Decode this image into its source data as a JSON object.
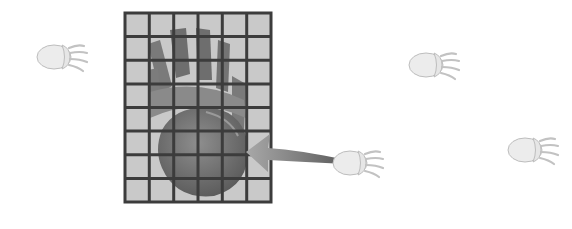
{
  "diagram": {
    "grid": {
      "columns": 6,
      "rows": 8,
      "x": 125,
      "y": 13,
      "width": 146,
      "height": 189,
      "fill": "#c9c9c9",
      "line_color": "#3c3c3c"
    },
    "large_paw": {
      "color": "#6e6e6e"
    },
    "small_paws": [
      {
        "x": 38,
        "y": 40,
        "label": "paw-print-left"
      },
      {
        "x": 408,
        "y": 48,
        "label": "paw-print-upper-right"
      },
      {
        "x": 332,
        "y": 146,
        "label": "paw-print-arrow-source"
      },
      {
        "x": 505,
        "y": 133,
        "label": "paw-print-far-right"
      }
    ],
    "arrow": {
      "from": [
        338,
        160
      ],
      "to": [
        248,
        148
      ],
      "color": "#7a7a7a"
    },
    "colors": {
      "paw_fill": "#ececec",
      "paw_stroke": "#bdbdbd",
      "background": "#ffffff"
    }
  }
}
